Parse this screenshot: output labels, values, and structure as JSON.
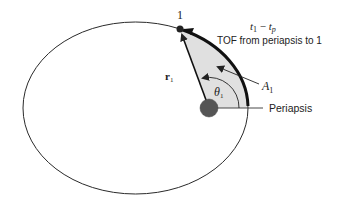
{
  "diagram": {
    "colors": {
      "background": "#ffffff",
      "orbit": "#2a2a2a",
      "sector_fill": "#e0e0e0",
      "focus": "#555555",
      "text": "#222222"
    },
    "labels": {
      "point_1": "1",
      "time_expr_t": "t",
      "time_expr_sub1": "1",
      "time_expr_minus": " − ",
      "time_expr_tp": "t",
      "time_expr_subp": "p",
      "tof_description": "TOF from periapsis to 1",
      "area_A": "A",
      "area_sub": "1",
      "radius_r": "r",
      "radius_sub": "1",
      "angle_theta": "θ",
      "angle_sub": "1",
      "periapsis": "Periapsis"
    }
  }
}
